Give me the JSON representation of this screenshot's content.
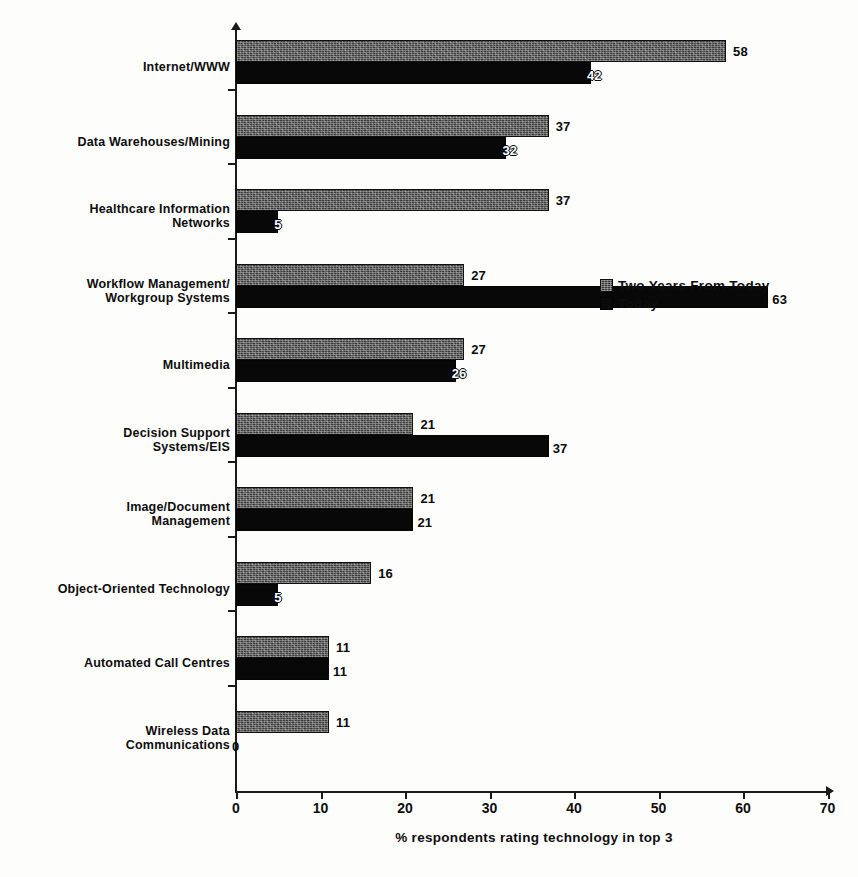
{
  "chart_data": {
    "type": "bar",
    "orientation": "horizontal",
    "title": "",
    "xlabel": "% respondents rating technology in top 3",
    "ylabel": "",
    "xlim": [
      0,
      70
    ],
    "xticks": [
      0,
      10,
      20,
      30,
      40,
      50,
      60,
      70
    ],
    "grid": false,
    "legend_position": "center-right",
    "categories": [
      "Internet/WWW",
      "Data Warehouses/Mining",
      "Healthcare Information Networks",
      "Workflow Management/Workgroup Systems",
      "Multimedia",
      "Decision Support Systems/EIS",
      "Image/Document Management",
      "Object-Oriented Technology",
      "Automated Call Centres",
      "Wireless Data Communications"
    ],
    "series": [
      {
        "name": "Two Years From Today",
        "values": [
          58,
          37,
          37,
          27,
          27,
          21,
          21,
          16,
          11,
          11
        ]
      },
      {
        "name": "Today",
        "values": [
          42,
          32,
          5,
          63,
          26,
          37,
          21,
          5,
          11,
          0
        ]
      }
    ]
  },
  "axis": {
    "x_title": "% respondents rating technology in top 3",
    "x_tick_labels": [
      "0",
      "10",
      "20",
      "30",
      "40",
      "50",
      "60",
      "70"
    ]
  },
  "legend": {
    "items": [
      {
        "label": "Two Years From Today",
        "swatch": "hatched-dark-gray"
      },
      {
        "label": "Today",
        "swatch": "solid-black"
      }
    ]
  },
  "categories_display": [
    {
      "lines": [
        "Internet/WWW"
      ]
    },
    {
      "lines": [
        "Data Warehouses/Mining"
      ]
    },
    {
      "lines": [
        "Healthcare Information",
        "Networks"
      ]
    },
    {
      "lines": [
        "Workflow Management/",
        "Workgroup Systems"
      ]
    },
    {
      "lines": [
        "Multimedia"
      ]
    },
    {
      "lines": [
        "Decision Support",
        "Systems/EIS"
      ]
    },
    {
      "lines": [
        "Image/Document",
        "Management"
      ]
    },
    {
      "lines": [
        "Object-Oriented Technology"
      ]
    },
    {
      "lines": [
        "Automated Call Centres"
      ]
    },
    {
      "lines": [
        "Wireless Data",
        "Communications"
      ]
    }
  ],
  "value_labels": {
    "future": [
      "58",
      "37",
      "37",
      "27",
      "27",
      "21",
      "21",
      "16",
      "11",
      "11"
    ],
    "today": [
      "42",
      "32",
      "5",
      "63",
      "26",
      "37",
      "21",
      "5",
      "11",
      "0"
    ]
  },
  "colors": {
    "future_bar": "#3a3a3a",
    "today_bar": "#080808",
    "axis": "#1a1a1a",
    "text": "#0d0d0d",
    "background": "#fdfdfc"
  }
}
